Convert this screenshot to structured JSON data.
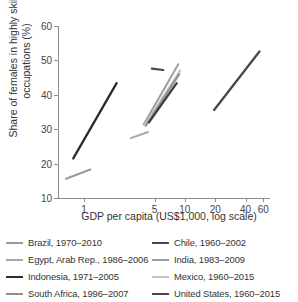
{
  "chart_data": {
    "type": "line",
    "title": "",
    "xlabel": "GDP per capita (US$1,000, log scale)",
    "ylabel": "Share of females in highly skilled occupations (%)",
    "xscale": "log",
    "xlim": [
      0.55,
      70
    ],
    "ylim": [
      10,
      60
    ],
    "xticks": [
      1,
      5,
      10,
      20,
      40,
      60
    ],
    "xtick_labels": [
      "1",
      "5",
      "10",
      "20",
      "40",
      "60"
    ],
    "yticks": [
      10,
      20,
      30,
      40,
      50,
      60
    ],
    "ytick_labels": [
      "10",
      "20",
      "30",
      "40",
      "50",
      "60"
    ],
    "grid": false,
    "legend_position": "below",
    "series": [
      {
        "name": "Brazil, 1970–2010",
        "color": "#9a9a9a",
        "width": 2.0,
        "points": [
          [
            0.66,
            15.6
          ],
          [
            1.15,
            18.3
          ]
        ]
      },
      {
        "name": "Chile, 1960–2002",
        "color": "#4a4a4a",
        "width": 2.2,
        "points": [
          [
            4.7,
            47.6
          ],
          [
            6.1,
            47.2
          ]
        ]
      },
      {
        "name": "Egypt, Arab Rep., 1986–2006",
        "color": "#a8a8a8",
        "width": 2.0,
        "points": [
          [
            2.9,
            27.4
          ],
          [
            4.3,
            29.2
          ]
        ]
      },
      {
        "name": "India, 1983–2009",
        "color": "#9e9e9e",
        "width": 2.0,
        "points": [
          [
            3.9,
            31.4
          ],
          [
            8.6,
            48.9
          ]
        ]
      },
      {
        "name": "Indonesia, 1971–2005",
        "color": "#2b2b2b",
        "width": 2.3,
        "points": [
          [
            0.78,
            21.5
          ],
          [
            2.1,
            43.4
          ]
        ]
      },
      {
        "name": "Mexico, 1960–2015",
        "color": "#c4c4c4",
        "width": 2.2,
        "points": [
          [
            4.0,
            31.2
          ],
          [
            9.0,
            47.1
          ]
        ]
      },
      {
        "name": "South Africa, 1996–2007",
        "color": "#8f8f8f",
        "width": 2.0,
        "points": [
          [
            4.1,
            31.0
          ],
          [
            8.8,
            46.0
          ]
        ]
      },
      {
        "name": "United States, 1960–2015",
        "color": "#474747",
        "width": 2.3,
        "points": [
          [
            19.5,
            35.6
          ],
          [
            55.0,
            52.6
          ]
        ]
      }
    ],
    "extra_segments": [
      {
        "name": "Mexico, 1960–2015 (upper)",
        "color": "#3c3c3c",
        "width": 2.2,
        "points": [
          [
            4.4,
            32.0
          ],
          [
            8.3,
            43.4
          ]
        ]
      }
    ]
  },
  "legend": {
    "items": [
      {
        "label": "Brazil, 1970–2010",
        "color": "#9a9a9a"
      },
      {
        "label": "Chile, 1960–2002",
        "color": "#4a4a4a"
      },
      {
        "label": "Egypt, Arab Rep., 1986–2006",
        "color": "#a8a8a8"
      },
      {
        "label": "India, 1983–2009",
        "color": "#9e9e9e"
      },
      {
        "label": "Indonesia, 1971–2005",
        "color": "#2b2b2b"
      },
      {
        "label": "Mexico, 1960–2015",
        "color": "#c4c4c4"
      },
      {
        "label": "South Africa, 1996–2007",
        "color": "#8f8f8f"
      },
      {
        "label": "United States, 1960–2015",
        "color": "#474747"
      }
    ]
  }
}
